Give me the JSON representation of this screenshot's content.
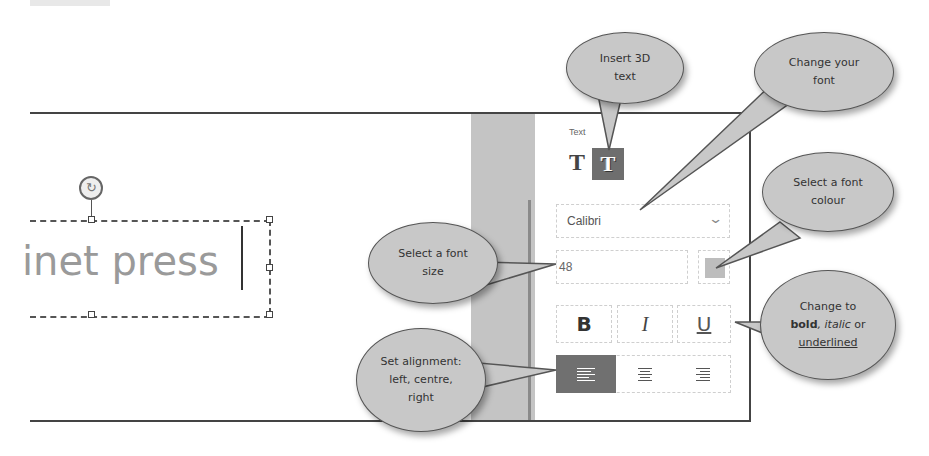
{
  "canvas": {
    "text": "inet press",
    "rotate_icon": "rotate-icon"
  },
  "panel": {
    "section_label": "Text",
    "text_type_buttons": [
      {
        "name": "plain-text",
        "glyph": "T",
        "selected": false
      },
      {
        "name": "3d-text",
        "glyph": "T",
        "selected": true
      }
    ],
    "font_select": {
      "value": "Calibri",
      "icon": "chevron-down-icon"
    },
    "font_size": {
      "value": "48"
    },
    "font_colour": {
      "swatch": "#bdbdbd"
    },
    "style_buttons": [
      {
        "name": "bold",
        "label": "B"
      },
      {
        "name": "italic",
        "label": "I"
      },
      {
        "name": "underline",
        "label": "U"
      }
    ],
    "alignment_buttons": [
      {
        "name": "align-left",
        "selected": true
      },
      {
        "name": "align-center",
        "selected": false
      },
      {
        "name": "align-right",
        "selected": false
      }
    ],
    "accent_color": "#6e6e6e"
  },
  "callouts": {
    "insert3d": {
      "line1": "Insert 3D",
      "line2": "text"
    },
    "change_font": {
      "line1": "Change your",
      "line2": "font"
    },
    "font_colour": {
      "line1": "Select a font",
      "line2": "colour"
    },
    "font_size": {
      "line1": "Select a font",
      "line2": "size"
    },
    "style": {
      "line1": "Change to",
      "bold": "bold",
      "sep": ", ",
      "italic": "italic",
      "or": " or",
      "underlined": "underlined"
    },
    "alignment": {
      "line1": "Set alignment:",
      "line2": "left, centre,",
      "line3": "right"
    }
  }
}
